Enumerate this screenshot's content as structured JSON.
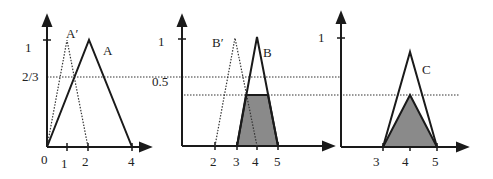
{
  "figure": {
    "colors": {
      "line": "#1a1a1a",
      "shade": "#8a8a8a",
      "background": "#ffffff"
    }
  },
  "panel1": {
    "y_tick_label": "1",
    "level_label": "2/3",
    "x_ticks": [
      "0",
      "1",
      "2",
      "4"
    ],
    "set_label": "A",
    "obs_label": "A′"
  },
  "panel2": {
    "y_tick_label": "1",
    "level_label": "0.5",
    "x_ticks": [
      "2",
      "3",
      "4",
      "5"
    ],
    "set_label": "B",
    "obs_label": "B′"
  },
  "panel3": {
    "y_tick_label": "1",
    "x_ticks": [
      "3",
      "4",
      "5"
    ],
    "set_label": "C"
  }
}
